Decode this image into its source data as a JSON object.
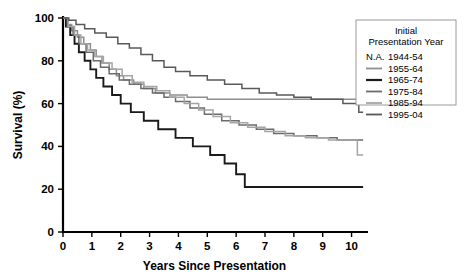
{
  "chart_data": {
    "type": "line",
    "title": "",
    "xlabel": "Years Since Presentation",
    "ylabel": "Survival (%)",
    "xlim": [
      0,
      10.5
    ],
    "ylim": [
      0,
      100
    ],
    "xticks": [
      "0",
      "1",
      "2",
      "3",
      "4",
      "5",
      "6",
      "7",
      "8",
      "9",
      "10"
    ],
    "yticks": [
      "0",
      "20",
      "40",
      "60",
      "80",
      "100"
    ],
    "grid": false,
    "legend_position": "top-right",
    "legend_title": "Initial\nPresentation Year",
    "legend_title_line1": "Initial",
    "legend_title_line2": "Presentation Year",
    "series": [
      {
        "name": "1944-54",
        "swatch": "N.A.",
        "has_line": false,
        "color": "#808080",
        "width": 1.4,
        "points": []
      },
      {
        "name": "1955-64",
        "swatch": "line",
        "has_line": true,
        "color": "#8e8e8e",
        "width": 1.5,
        "points": [
          [
            0,
            100
          ],
          [
            0.12,
            97
          ],
          [
            0.3,
            94
          ],
          [
            0.5,
            91
          ],
          [
            0.72,
            88
          ],
          [
            0.95,
            85
          ],
          [
            1.15,
            82
          ],
          [
            1.35,
            79
          ],
          [
            1.6,
            76
          ],
          [
            1.85,
            73
          ],
          [
            2.1,
            71
          ],
          [
            2.45,
            69
          ],
          [
            2.8,
            67
          ],
          [
            3.2,
            65
          ],
          [
            3.7,
            64
          ],
          [
            4.3,
            63
          ],
          [
            5.0,
            62
          ],
          [
            5.8,
            62
          ],
          [
            6.6,
            62
          ],
          [
            7.4,
            62
          ],
          [
            8.2,
            62
          ],
          [
            9.0,
            62
          ],
          [
            9.6,
            62
          ],
          [
            10.1,
            62
          ],
          [
            10.4,
            62
          ]
        ]
      },
      {
        "name": "1965-74",
        "swatch": "line",
        "has_line": true,
        "color": "#1a1a1a",
        "width": 1.9,
        "points": [
          [
            0,
            100
          ],
          [
            0.1,
            96
          ],
          [
            0.25,
            92
          ],
          [
            0.4,
            88
          ],
          [
            0.55,
            84
          ],
          [
            0.75,
            80
          ],
          [
            0.95,
            76
          ],
          [
            1.15,
            72
          ],
          [
            1.4,
            68
          ],
          [
            1.7,
            64
          ],
          [
            2.0,
            60
          ],
          [
            2.35,
            56
          ],
          [
            2.8,
            52
          ],
          [
            3.3,
            48
          ],
          [
            3.9,
            44
          ],
          [
            4.5,
            40
          ],
          [
            5.1,
            36
          ],
          [
            5.6,
            32
          ],
          [
            6.0,
            27
          ],
          [
            6.3,
            21
          ],
          [
            7.0,
            21
          ],
          [
            8.0,
            21
          ],
          [
            9.0,
            21
          ],
          [
            10.0,
            21
          ],
          [
            10.4,
            21
          ]
        ]
      },
      {
        "name": "1975-84",
        "swatch": "line",
        "has_line": true,
        "color": "#6b6b6b",
        "width": 1.5,
        "points": [
          [
            0,
            100
          ],
          [
            0.15,
            96
          ],
          [
            0.35,
            92
          ],
          [
            0.55,
            88
          ],
          [
            0.8,
            84
          ],
          [
            1.05,
            80
          ],
          [
            1.3,
            77
          ],
          [
            1.6,
            74
          ],
          [
            1.95,
            71
          ],
          [
            2.3,
            69
          ],
          [
            2.7,
            67
          ],
          [
            3.1,
            65
          ],
          [
            3.5,
            63
          ],
          [
            3.9,
            61
          ],
          [
            4.4,
            58
          ],
          [
            4.9,
            55
          ],
          [
            5.5,
            52
          ],
          [
            6.1,
            50
          ],
          [
            6.7,
            48
          ],
          [
            7.3,
            46
          ],
          [
            8.0,
            45
          ],
          [
            8.8,
            44
          ],
          [
            9.5,
            43
          ],
          [
            10.1,
            43
          ],
          [
            10.4,
            43
          ]
        ]
      },
      {
        "name": "1985-94",
        "swatch": "line",
        "has_line": true,
        "color": "#a5a5a5",
        "width": 1.5,
        "points": [
          [
            0,
            100
          ],
          [
            0.18,
            96
          ],
          [
            0.4,
            92
          ],
          [
            0.62,
            88
          ],
          [
            0.85,
            85
          ],
          [
            1.1,
            82
          ],
          [
            1.4,
            79
          ],
          [
            1.7,
            76
          ],
          [
            2.05,
            73
          ],
          [
            2.4,
            70
          ],
          [
            2.8,
            68
          ],
          [
            3.25,
            66
          ],
          [
            3.7,
            63
          ],
          [
            4.2,
            60
          ],
          [
            4.7,
            57
          ],
          [
            5.2,
            54
          ],
          [
            5.8,
            51
          ],
          [
            6.4,
            49
          ],
          [
            7.0,
            47
          ],
          [
            7.7,
            45
          ],
          [
            8.4,
            44
          ],
          [
            9.2,
            43
          ],
          [
            9.9,
            43
          ],
          [
            10.2,
            36
          ],
          [
            10.4,
            36
          ]
        ]
      },
      {
        "name": "1995-04",
        "swatch": "line",
        "has_line": true,
        "color": "#595959",
        "width": 1.5,
        "points": [
          [
            0,
            100
          ],
          [
            0.2,
            99
          ],
          [
            0.45,
            97
          ],
          [
            0.75,
            95
          ],
          [
            1.1,
            93
          ],
          [
            1.5,
            91
          ],
          [
            1.9,
            88
          ],
          [
            2.3,
            86
          ],
          [
            2.7,
            83
          ],
          [
            3.1,
            80
          ],
          [
            3.5,
            77
          ],
          [
            3.9,
            75
          ],
          [
            4.4,
            73
          ],
          [
            5.0,
            71
          ],
          [
            5.6,
            69
          ],
          [
            6.2,
            67
          ],
          [
            6.8,
            65
          ],
          [
            7.4,
            64
          ],
          [
            8.0,
            63
          ],
          [
            8.6,
            62
          ],
          [
            9.2,
            62
          ],
          [
            9.7,
            60
          ],
          [
            10.0,
            60
          ],
          [
            10.25,
            56
          ],
          [
            10.4,
            56
          ]
        ]
      }
    ]
  }
}
